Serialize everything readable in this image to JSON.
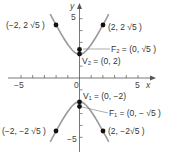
{
  "chart_data": {
    "type": "line",
    "title": "",
    "xlabel": "x",
    "ylabel": "y",
    "xlim": [
      -6,
      6
    ],
    "ylim": [
      -6.5,
      6.5
    ],
    "x_ticks": [
      -5,
      -4,
      -3,
      -2,
      -1,
      0,
      1,
      2,
      3,
      4,
      5
    ],
    "y_ticks": [
      -5,
      -4,
      -3,
      -2,
      -1,
      1,
      2,
      3,
      4,
      5
    ],
    "x_tick_labels": {
      "-5": "−5",
      "0": "0",
      "5": "5"
    },
    "y_tick_labels": {
      "5": "5",
      "-5": "−5"
    },
    "grid": false,
    "curve": "hyperbola y^2/4 - x^2 = 1",
    "series": [
      {
        "name": "upper branch",
        "equation": "y = 2*sqrt(1+x^2)",
        "x_range": [
          -2.5,
          2.5
        ]
      },
      {
        "name": "lower branch",
        "equation": "y = -2*sqrt(1+x^2)",
        "x_range": [
          -2.5,
          2.5
        ]
      }
    ],
    "points": [
      {
        "label": "(−2, 2 √5 )",
        "x": -2,
        "y": 4.472
      },
      {
        "label": "(2, 2 √5 )",
        "x": 2,
        "y": 4.472
      },
      {
        "label": "F₂ = (0, √5 )",
        "x": 0,
        "y": 2.236
      },
      {
        "label": "V₂ = (0, 2)",
        "x": 0,
        "y": 2
      },
      {
        "label": "V₁ = (0, −2)",
        "x": 0,
        "y": -2
      },
      {
        "label": "F₁ = (0, − √5 )",
        "x": 0,
        "y": -2.236
      },
      {
        "label": "(−2, −2 √5 )",
        "x": -2,
        "y": -4.472
      },
      {
        "label": "(2, −2√5 )",
        "x": 2,
        "y": -4.472
      }
    ],
    "colors": {
      "curve": "#9a9a9a",
      "points": "#111111",
      "axes": "#555555",
      "text": "#333333"
    }
  },
  "labels": {
    "x_axis": "x",
    "y_axis": "y",
    "tick_x_neg5": "−5",
    "tick_x_0": "0",
    "tick_x_5": "5",
    "tick_y_5": "5",
    "tick_y_neg5": "−5",
    "pt_ul": "(−2, 2 √5 )",
    "pt_ur": "(2, 2 √5 )",
    "f2": "F₂ = (0, √5 )",
    "v2": "V₂ = (0, 2)",
    "v1": "V₁ = (0, −2)",
    "f1": "F₁ = (0, − √5 )",
    "pt_ll": "(−2, −2 √5 )",
    "pt_lr": "(2, −2√5 )"
  }
}
